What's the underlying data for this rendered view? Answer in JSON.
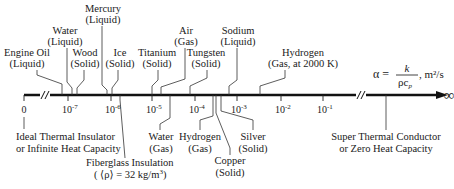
{
  "diagram": {
    "formula": {
      "lhs": "α =",
      "numerator": "k",
      "denominator_rho": "ρc",
      "denominator_sub": "p",
      "units": ", m²/s"
    },
    "infinity": "∞",
    "ticks": [
      {
        "label": "0",
        "x": 24
      },
      {
        "label": "10",
        "exp": "-7",
        "x": 68
      },
      {
        "label": "10",
        "exp": "-6",
        "x": 111
      },
      {
        "label": "10",
        "exp": "-5",
        "x": 152
      },
      {
        "label": "10",
        "exp": "-4",
        "x": 195
      },
      {
        "label": "10",
        "exp": "-3",
        "x": 237
      },
      {
        "label": "10",
        "exp": "-2",
        "x": 281
      },
      {
        "label": "10",
        "exp": "-1",
        "x": 323
      }
    ],
    "top_labels": {
      "engine_oil": {
        "line1": "Engine Oil",
        "line2": "(Liquid)"
      },
      "water_liquid": {
        "line1": "Water",
        "line2": "(Liquid)"
      },
      "wood": {
        "line1": "Wood",
        "line2": "(Solid)"
      },
      "mercury": {
        "line1": "Mercury",
        "line2": "(Liquid)"
      },
      "ice": {
        "line1": "Ice",
        "line2": "(Solid)"
      },
      "titanium": {
        "line1": "Titanium",
        "line2": "(Solid)"
      },
      "air": {
        "line1": "Air",
        "line2": "(Gas)"
      },
      "tungsten": {
        "line1": "Tungsten",
        "line2": "(Solid)"
      },
      "sodium": {
        "line1": "Sodium",
        "line2": "(Liquid)"
      },
      "hydrogen_2000k": {
        "line1": "Hydrogen",
        "line2": "(Gas, at 2000 K)"
      }
    },
    "bottom_labels": {
      "ideal_insulator": {
        "line1": "Ideal Thermal Insulator",
        "line2": "or Infinite Heat Capacity"
      },
      "fiberglass": {
        "line1": "Fiberglass Insulation",
        "line2a": "( ⟨ρ⟩ = 32 kg/m",
        "line2_sup": "3",
        "line2b": ")"
      },
      "water_gas": {
        "line1": "Water",
        "line2": "(Gas)"
      },
      "hydrogen_gas": {
        "line1": "Hydrogen",
        "line2": "(Gas)"
      },
      "copper": {
        "line1": "Copper",
        "line2": "(Solid)"
      },
      "silver": {
        "line1": "Silver",
        "line2": "(Solid)"
      },
      "super_conductor": {
        "line1": "Super Thermal Conductor",
        "line2": "or Zero Heat Capacity"
      }
    }
  }
}
